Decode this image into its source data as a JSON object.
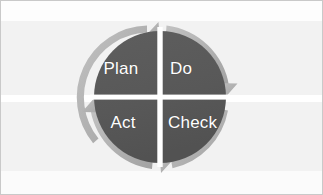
{
  "canvas": {
    "width": 323,
    "height": 195,
    "background_color": "#f2f2f2",
    "border_color": "#c9c9c9",
    "band_color": "#ffffff"
  },
  "diagram": {
    "type": "pdca-cycle",
    "center": {
      "x": 160,
      "y": 97
    },
    "circle_radius": 66,
    "circle_color": "#595959",
    "arrow_ring_color": "#b0b0b0",
    "divider_color": "#ffffff",
    "label_color": "#ffffff",
    "rotation_direction": "clockwise",
    "quadrants": [
      {
        "id": "plan",
        "label": "Plan",
        "position": "top-left"
      },
      {
        "id": "do",
        "label": "Do",
        "position": "top-right"
      },
      {
        "id": "check",
        "label": "Check",
        "position": "bottom-right"
      },
      {
        "id": "act",
        "label": "Act",
        "position": "bottom-left"
      }
    ],
    "arrows": [
      {
        "id": "arrow-top",
        "head_position": "12-oclock",
        "points": "up-right"
      },
      {
        "id": "arrow-right",
        "head_position": "3-oclock",
        "points": "down"
      },
      {
        "id": "arrow-bottom",
        "head_position": "6-oclock",
        "points": "down-left"
      },
      {
        "id": "arrow-left",
        "head_position": "9-oclock",
        "points": "up"
      }
    ]
  }
}
